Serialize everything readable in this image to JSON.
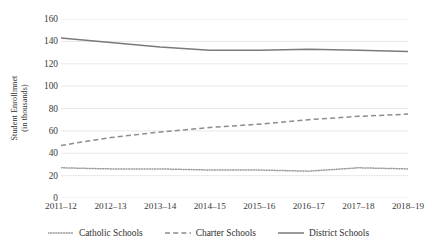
{
  "chart_data": {
    "type": "line",
    "title": "",
    "xlabel": "",
    "ylabel": "Student Enrollmnet (in thousands)",
    "ylabel_line1": "Student Enrollmnet",
    "ylabel_line2": "(in thousands)",
    "ylim": [
      0,
      160
    ],
    "ytick_step": 20,
    "yticks": [
      160,
      140,
      120,
      100,
      80,
      60,
      40,
      20,
      0
    ],
    "grid": true,
    "grid_axis": "y",
    "legend_position": "bottom",
    "categories": [
      "2011–12",
      "2012–13",
      "2013–14",
      "2014–15",
      "2015–16",
      "2016–17",
      "2017–18",
      "2018–19"
    ],
    "series": [
      {
        "name": "Catholic Schools",
        "style": "dotted",
        "color": "#9a9a9a",
        "values": [
          27,
          26,
          26,
          25,
          25,
          24,
          27,
          26
        ]
      },
      {
        "name": "Charter Schools",
        "style": "dashed",
        "color": "#8c8c8c",
        "values": [
          47,
          54,
          59,
          63,
          66,
          70,
          73,
          75
        ]
      },
      {
        "name": "District Schools",
        "style": "solid",
        "color": "#7a7a7a",
        "values": [
          143,
          139,
          135,
          132,
          132,
          133,
          132,
          131
        ]
      }
    ]
  },
  "colors": {
    "background": "#ffffff",
    "gridline": "#e8e8e8",
    "text": "#3a3a3a",
    "catholic": "#9a9a9a",
    "charter": "#8c8c8c",
    "district": "#7a7a7a"
  }
}
